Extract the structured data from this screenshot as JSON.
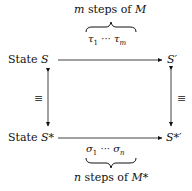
{
  "diagram": {
    "top_label": {
      "prefix": "m",
      "text": " steps of ",
      "machine": "M"
    },
    "top_sequence": {
      "first": "τ",
      "first_sub": "1",
      "dots": "···",
      "last": "τ",
      "last_sub": "m"
    },
    "bottom_sequence": {
      "first": "σ",
      "first_sub": "1",
      "dots": "···",
      "last": "σ",
      "last_sub": "n"
    },
    "bottom_label": {
      "prefix": "n",
      "text": " steps of ",
      "machine": "M*"
    },
    "nodes": {
      "top_left": {
        "word": "State ",
        "symbol": "S"
      },
      "top_right": {
        "symbol": "S′"
      },
      "bottom_left": {
        "word": "State ",
        "symbol": "S*"
      },
      "bottom_right": {
        "symbol": "S*′"
      }
    },
    "equiv_symbol": "≡"
  }
}
